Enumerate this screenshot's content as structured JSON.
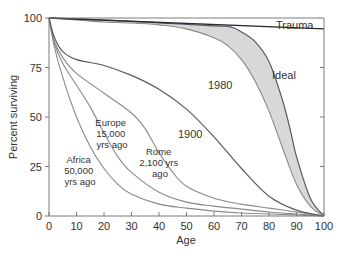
{
  "chart_data": {
    "type": "line",
    "title": "",
    "xlabel": "Age",
    "ylabel": "Percent surviving",
    "xlim": [
      0,
      100
    ],
    "ylim": [
      0,
      100
    ],
    "x_ticks": [
      0,
      10,
      20,
      30,
      40,
      50,
      60,
      70,
      80,
      90,
      100
    ],
    "y_ticks": [
      0,
      25,
      50,
      75,
      100
    ],
    "grid": false,
    "legend": "none (curves labeled inline)",
    "series": [
      {
        "name": "Africa 50,000 yrs ago",
        "label_lines": [
          "Africa",
          "50,000",
          "yrs ago"
        ],
        "x": [
          0,
          2,
          5,
          10,
          15,
          20,
          25,
          30,
          40,
          50,
          60,
          70,
          80,
          90,
          100
        ],
        "y": [
          100,
          85,
          70,
          50,
          35,
          24,
          16,
          11,
          6,
          4,
          2.5,
          1.5,
          1,
          0.5,
          0
        ]
      },
      {
        "name": "Europe 15,000 yrs ago",
        "label_lines": [
          "Europe",
          "15,000",
          "yrs ago"
        ],
        "x": [
          0,
          2,
          5,
          10,
          15,
          20,
          25,
          30,
          40,
          50,
          60,
          70,
          80,
          90,
          100
        ],
        "y": [
          100,
          87,
          77,
          66,
          55,
          42,
          30,
          22,
          12,
          7,
          5,
          3.5,
          2,
          1,
          0
        ]
      },
      {
        "name": "Rome 2,100 yrs ago",
        "label_lines": [
          "Rome",
          "2,100 yrs",
          "ago"
        ],
        "x": [
          0,
          2,
          5,
          10,
          20,
          30,
          35,
          40,
          45,
          50,
          60,
          70,
          80,
          90,
          100
        ],
        "y": [
          100,
          88,
          80,
          72,
          62,
          52,
          44,
          32,
          22,
          15,
          9,
          6,
          4,
          2,
          0
        ]
      },
      {
        "name": "1900",
        "label_lines": [
          "1900"
        ],
        "x": [
          0,
          2,
          5,
          10,
          20,
          30,
          40,
          50,
          60,
          70,
          80,
          90,
          100
        ],
        "y": [
          100,
          90,
          83,
          79,
          76,
          71,
          64,
          54,
          40,
          24,
          10,
          3,
          0
        ]
      },
      {
        "name": "1980",
        "label_lines": [
          "1980"
        ],
        "x": [
          0,
          10,
          20,
          30,
          40,
          50,
          60,
          65,
          70,
          75,
          80,
          85,
          90,
          95,
          100
        ],
        "y": [
          100,
          99,
          98,
          97.5,
          96.5,
          94.5,
          90,
          86,
          79,
          68,
          53,
          34,
          16,
          5,
          0
        ]
      },
      {
        "name": "Ideal",
        "label_lines": [
          "Ideal"
        ],
        "x": [
          0,
          20,
          40,
          60,
          66,
          70,
          75,
          80,
          85,
          88,
          90,
          95,
          100
        ],
        "y": [
          100,
          99,
          97.5,
          96,
          95.5,
          93,
          88,
          78,
          58,
          42,
          30,
          9,
          0
        ]
      },
      {
        "name": "Trauma",
        "label_lines": [
          "Trauma"
        ],
        "x": [
          0,
          100
        ],
        "y": [
          100,
          94.5
        ]
      }
    ],
    "annotations": [
      {
        "text": "Shaded region between 1980 and Ideal curves"
      }
    ]
  },
  "labels": {
    "xlabel": "Age",
    "ylabel": "Percent surviving",
    "trauma": "Trauma",
    "ideal": "Ideal",
    "y1980": "1980",
    "y1900": "1900",
    "rome": [
      "Rome",
      "2,100 yrs",
      "ago"
    ],
    "europe": [
      "Europe",
      "15,000",
      "yrs ago"
    ],
    "africa": [
      "Africa",
      "50,000",
      "yrs ago"
    ]
  },
  "colors": {
    "band": "#d8d8d8",
    "curve": "#8a8a8a",
    "curve_dark": "#555a66",
    "trauma": "#2a2a2a",
    "axis": "#7a7a7a",
    "text": "#333333"
  }
}
